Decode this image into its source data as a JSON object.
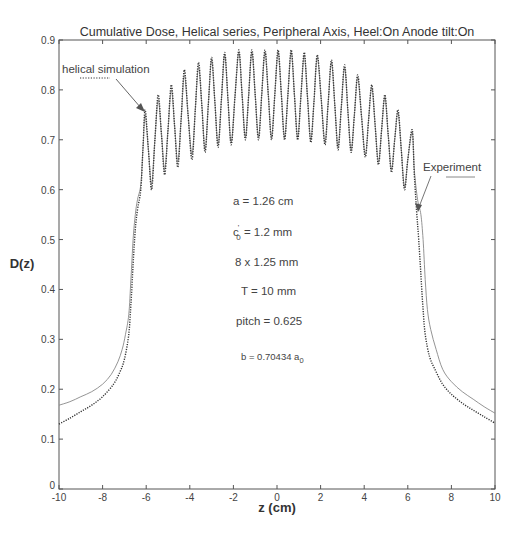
{
  "chart_data": {
    "type": "line",
    "title": "Cumulative Dose, Helical series, Peripheral Axis, Heel:On  Anode tilt:On",
    "xlabel": "z (cm)",
    "ylabel": "D(z)",
    "xlim": [
      -10,
      10
    ],
    "ylim": [
      0,
      0.9
    ],
    "xticks": [
      -10,
      -8,
      -6,
      -4,
      -2,
      0,
      2,
      4,
      6,
      8,
      10
    ],
    "yticks": [
      0,
      0.1,
      0.2,
      0.3,
      0.4,
      0.5,
      0.6,
      0.7,
      0.8,
      0.9
    ],
    "grid": false,
    "legend": "inline annotations with arrows",
    "series": [
      {
        "name": "helical simulation",
        "style": "dotted",
        "color": "#333333",
        "points": [
          [
            -10,
            0.13
          ],
          [
            -9.5,
            0.142
          ],
          [
            -9,
            0.155
          ],
          [
            -8.5,
            0.168
          ],
          [
            -8,
            0.185
          ],
          [
            -7.5,
            0.21
          ],
          [
            -7.2,
            0.235
          ],
          [
            -7,
            0.26
          ],
          [
            -6.8,
            0.31
          ],
          [
            -6.7,
            0.37
          ],
          [
            -6.6,
            0.45
          ],
          [
            -6.5,
            0.52
          ],
          [
            -6.4,
            0.56
          ],
          [
            -6.25,
            0.6
          ],
          [
            -6.15,
            0.68
          ],
          [
            -6.05,
            0.76
          ],
          [
            -5.9,
            0.68
          ],
          [
            -5.75,
            0.6
          ],
          [
            -5.6,
            0.7
          ],
          [
            -5.45,
            0.79
          ],
          [
            -5.3,
            0.71
          ],
          [
            -5.15,
            0.63
          ],
          [
            -5.0,
            0.72
          ],
          [
            -4.85,
            0.81
          ],
          [
            -4.7,
            0.73
          ],
          [
            -4.55,
            0.645
          ],
          [
            -4.4,
            0.74
          ],
          [
            -4.25,
            0.84
          ],
          [
            -4.08,
            0.75
          ],
          [
            -3.9,
            0.66
          ],
          [
            -3.75,
            0.76
          ],
          [
            -3.6,
            0.855
          ],
          [
            -3.45,
            0.77
          ],
          [
            -3.3,
            0.675
          ],
          [
            -3.15,
            0.77
          ],
          [
            -3.0,
            0.865
          ],
          [
            -2.85,
            0.775
          ],
          [
            -2.7,
            0.685
          ],
          [
            -2.55,
            0.78
          ],
          [
            -2.4,
            0.875
          ],
          [
            -2.25,
            0.78
          ],
          [
            -2.1,
            0.69
          ],
          [
            -1.93,
            0.785
          ],
          [
            -1.75,
            0.88
          ],
          [
            -1.6,
            0.79
          ],
          [
            -1.45,
            0.7
          ],
          [
            -1.3,
            0.79
          ],
          [
            -1.15,
            0.88
          ],
          [
            -1.0,
            0.79
          ],
          [
            -0.85,
            0.7
          ],
          [
            -0.7,
            0.79
          ],
          [
            -0.55,
            0.88
          ],
          [
            -0.4,
            0.79
          ],
          [
            -0.25,
            0.7
          ],
          [
            -0.1,
            0.79
          ],
          [
            0.05,
            0.88
          ],
          [
            0.2,
            0.79
          ],
          [
            0.35,
            0.7
          ],
          [
            0.5,
            0.79
          ],
          [
            0.65,
            0.88
          ],
          [
            0.8,
            0.79
          ],
          [
            0.95,
            0.7
          ],
          [
            1.1,
            0.79
          ],
          [
            1.25,
            0.875
          ],
          [
            1.4,
            0.785
          ],
          [
            1.55,
            0.695
          ],
          [
            1.7,
            0.78
          ],
          [
            1.85,
            0.87
          ],
          [
            2.03,
            0.78
          ],
          [
            2.2,
            0.69
          ],
          [
            2.35,
            0.775
          ],
          [
            2.5,
            0.86
          ],
          [
            2.65,
            0.77
          ],
          [
            2.8,
            0.68
          ],
          [
            2.95,
            0.765
          ],
          [
            3.1,
            0.85
          ],
          [
            3.25,
            0.76
          ],
          [
            3.4,
            0.675
          ],
          [
            3.55,
            0.75
          ],
          [
            3.7,
            0.83
          ],
          [
            3.88,
            0.745
          ],
          [
            4.05,
            0.665
          ],
          [
            4.2,
            0.74
          ],
          [
            4.35,
            0.81
          ],
          [
            4.5,
            0.73
          ],
          [
            4.65,
            0.65
          ],
          [
            4.8,
            0.72
          ],
          [
            4.95,
            0.79
          ],
          [
            5.1,
            0.71
          ],
          [
            5.25,
            0.635
          ],
          [
            5.4,
            0.7
          ],
          [
            5.55,
            0.76
          ],
          [
            5.7,
            0.68
          ],
          [
            5.85,
            0.6
          ],
          [
            6.0,
            0.66
          ],
          [
            6.2,
            0.72
          ],
          [
            6.3,
            0.63
          ],
          [
            6.4,
            0.56
          ],
          [
            6.5,
            0.5
          ],
          [
            6.6,
            0.43
          ],
          [
            6.7,
            0.36
          ],
          [
            6.8,
            0.31
          ],
          [
            7.0,
            0.265
          ],
          [
            7.3,
            0.235
          ],
          [
            7.6,
            0.21
          ],
          [
            8,
            0.19
          ],
          [
            8.5,
            0.172
          ],
          [
            9,
            0.158
          ],
          [
            9.5,
            0.145
          ],
          [
            10,
            0.132
          ]
        ]
      },
      {
        "name": "Experiment",
        "style": "solid",
        "color": "#888888",
        "points": [
          [
            -10,
            0.168
          ],
          [
            -9.5,
            0.175
          ],
          [
            -9,
            0.185
          ],
          [
            -8.5,
            0.195
          ],
          [
            -8,
            0.21
          ],
          [
            -7.6,
            0.23
          ],
          [
            -7.3,
            0.255
          ],
          [
            -7.1,
            0.28
          ],
          [
            -6.95,
            0.31
          ],
          [
            -6.8,
            0.35
          ],
          [
            -6.7,
            0.42
          ],
          [
            -6.6,
            0.5
          ],
          [
            -6.5,
            0.55
          ],
          [
            -6.4,
            0.58
          ],
          [
            -6.25,
            0.61
          ],
          [
            -6.15,
            0.68
          ],
          [
            -6.05,
            0.75
          ],
          [
            -5.9,
            0.68
          ],
          [
            -5.75,
            0.61
          ],
          [
            -5.6,
            0.7
          ],
          [
            -5.45,
            0.78
          ],
          [
            -5.3,
            0.71
          ],
          [
            -5.15,
            0.64
          ],
          [
            -5.0,
            0.72
          ],
          [
            -4.85,
            0.8
          ],
          [
            -4.7,
            0.73
          ],
          [
            -4.55,
            0.655
          ],
          [
            -4.4,
            0.74
          ],
          [
            -4.25,
            0.83
          ],
          [
            -4.08,
            0.75
          ],
          [
            -3.9,
            0.67
          ],
          [
            -3.75,
            0.76
          ],
          [
            -3.6,
            0.845
          ],
          [
            -3.45,
            0.77
          ],
          [
            -3.3,
            0.68
          ],
          [
            -3.15,
            0.77
          ],
          [
            -3.0,
            0.86
          ],
          [
            -2.85,
            0.775
          ],
          [
            -2.7,
            0.69
          ],
          [
            -2.55,
            0.78
          ],
          [
            -2.4,
            0.87
          ],
          [
            -2.25,
            0.78
          ],
          [
            -2.1,
            0.695
          ],
          [
            -1.93,
            0.785
          ],
          [
            -1.75,
            0.875
          ],
          [
            -1.6,
            0.79
          ],
          [
            -1.45,
            0.705
          ],
          [
            -1.3,
            0.79
          ],
          [
            -1.15,
            0.875
          ],
          [
            -1.0,
            0.79
          ],
          [
            -0.85,
            0.705
          ],
          [
            -0.7,
            0.79
          ],
          [
            -0.55,
            0.875
          ],
          [
            -0.4,
            0.79
          ],
          [
            -0.25,
            0.705
          ],
          [
            -0.1,
            0.79
          ],
          [
            0.05,
            0.875
          ],
          [
            0.2,
            0.79
          ],
          [
            0.35,
            0.705
          ],
          [
            0.5,
            0.79
          ],
          [
            0.65,
            0.875
          ],
          [
            0.8,
            0.79
          ],
          [
            0.95,
            0.705
          ],
          [
            1.1,
            0.79
          ],
          [
            1.25,
            0.87
          ],
          [
            1.4,
            0.785
          ],
          [
            1.55,
            0.7
          ],
          [
            1.7,
            0.78
          ],
          [
            1.85,
            0.865
          ],
          [
            2.03,
            0.78
          ],
          [
            2.2,
            0.695
          ],
          [
            2.35,
            0.775
          ],
          [
            2.5,
            0.855
          ],
          [
            2.65,
            0.77
          ],
          [
            2.8,
            0.685
          ],
          [
            2.95,
            0.765
          ],
          [
            3.1,
            0.845
          ],
          [
            3.25,
            0.76
          ],
          [
            3.4,
            0.68
          ],
          [
            3.55,
            0.75
          ],
          [
            3.7,
            0.825
          ],
          [
            3.88,
            0.745
          ],
          [
            4.05,
            0.67
          ],
          [
            4.2,
            0.74
          ],
          [
            4.35,
            0.805
          ],
          [
            4.5,
            0.73
          ],
          [
            4.65,
            0.655
          ],
          [
            4.8,
            0.72
          ],
          [
            4.95,
            0.785
          ],
          [
            5.1,
            0.71
          ],
          [
            5.25,
            0.64
          ],
          [
            5.4,
            0.7
          ],
          [
            5.55,
            0.755
          ],
          [
            5.7,
            0.68
          ],
          [
            5.85,
            0.605
          ],
          [
            6.0,
            0.66
          ],
          [
            6.2,
            0.715
          ],
          [
            6.3,
            0.64
          ],
          [
            6.45,
            0.58
          ],
          [
            6.6,
            0.55
          ],
          [
            6.7,
            0.5
          ],
          [
            6.8,
            0.42
          ],
          [
            6.9,
            0.36
          ],
          [
            7.05,
            0.32
          ],
          [
            7.3,
            0.28
          ],
          [
            7.6,
            0.24
          ],
          [
            8,
            0.215
          ],
          [
            8.5,
            0.195
          ],
          [
            9,
            0.18
          ],
          [
            9.5,
            0.165
          ],
          [
            10,
            0.152
          ]
        ]
      }
    ],
    "annotations": [
      {
        "text": "helical simulation",
        "target_series": "helical simulation",
        "arrow_to": [
          -6.05,
          0.76
        ]
      },
      {
        "text": "Experiment",
        "target_series": "Experiment",
        "arrow_to": [
          6.55,
          0.58
        ]
      },
      {
        "text": "a = 1.26  cm"
      },
      {
        "text": "c'0 = 1.2  mm"
      },
      {
        "text": "8 x 1.25 mm"
      },
      {
        "text": "T = 10 mm"
      },
      {
        "text": "pitch = 0.625"
      },
      {
        "text": "b = 0.70434 a0"
      }
    ]
  },
  "labels": {
    "title": "Cumulative Dose, Helical series, Peripheral Axis, Heel:On  Anode tilt:On",
    "xlabel": "z (cm)",
    "ylabel": "D(z)",
    "sim_label": "helical simulation",
    "exp_label": "Experiment",
    "param_a": "a = 1.26  cm",
    "param_c_base": "c",
    "param_c_prime": "'",
    "param_c_sub": "0",
    "param_c_rest": " = 1.2  mm",
    "param_detector": "8 x 1.25 mm",
    "param_T": "T = 10 mm",
    "param_pitch": "pitch = 0.625",
    "param_b_base": "b = 0.70434 a",
    "param_b_sub": "0"
  }
}
